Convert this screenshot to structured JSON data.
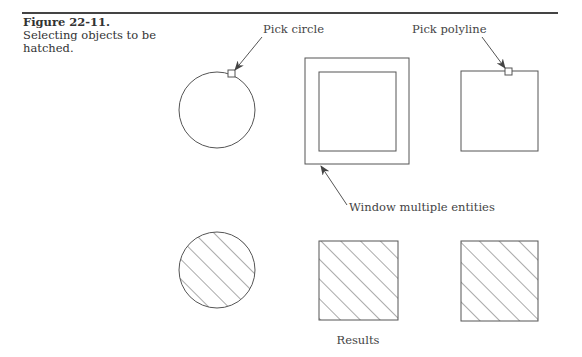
{
  "caption": {
    "figure_number": "Figure 22-11.",
    "text": "Selecting objects to be hatched."
  },
  "labels": {
    "pick_circle": "Pick circle",
    "pick_polyline": "Pick polyline",
    "window_multiple": "Window multiple entities",
    "results": "Results"
  },
  "colors": {
    "line": "#555555",
    "arrow": "#444444",
    "rule": "#444444"
  },
  "shapes": {
    "top_row": [
      {
        "type": "circle",
        "cx": 217,
        "cy": 110,
        "r": 38
      },
      {
        "type": "nested-squares",
        "outer": [
          305,
          58,
          104,
          106
        ],
        "inner": [
          319,
          72,
          77,
          79
        ]
      },
      {
        "type": "square",
        "rect": [
          461,
          71,
          77,
          80
        ]
      }
    ],
    "bottom_row": [
      {
        "type": "hatched-circle",
        "cx": 217,
        "cy": 270,
        "r": 38
      },
      {
        "type": "hatched-square",
        "rect": [
          319,
          241,
          79,
          79
        ]
      },
      {
        "type": "hatched-square",
        "rect": [
          461,
          241,
          77,
          80
        ]
      }
    ]
  }
}
